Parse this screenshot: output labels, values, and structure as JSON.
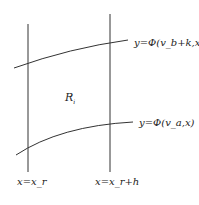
{
  "diagram": {
    "region_label": "R_i",
    "region_label_main": "R",
    "region_label_sub": "i",
    "upper_curve_label": "y=Φ(v_b+k,x)",
    "lower_curve_label": "y=Φ(v_a,x)",
    "left_line_label": "x=x_r",
    "right_line_label": "x=x_r+h",
    "colors": {
      "line": "#333333",
      "text": "#222222",
      "background": "#ffffff"
    }
  }
}
